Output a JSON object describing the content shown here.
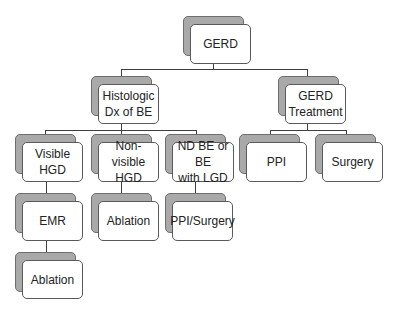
{
  "diagram": {
    "type": "tree",
    "nodes": {
      "root": {
        "label": "GERD"
      },
      "histologic": {
        "label": "Histologic\nDx of BE"
      },
      "treatment": {
        "label": "GERD\nTreatment"
      },
      "visible_hgd": {
        "label": "Visible HGD"
      },
      "nonvisible_hgd": {
        "label": "Non-visible\nHGD"
      },
      "ndbe_lgd": {
        "label": "ND BE or BE\nwith LGD"
      },
      "ppi": {
        "label": "PPI"
      },
      "surgery": {
        "label": "Surgery"
      },
      "emr": {
        "label": "EMR"
      },
      "ablation_nonvisible": {
        "label": "Ablation"
      },
      "ppi_surgery": {
        "label": "PPI/Surgery"
      },
      "ablation_after_emr": {
        "label": "Ablation"
      }
    },
    "edges": [
      [
        "root",
        "histologic"
      ],
      [
        "root",
        "treatment"
      ],
      [
        "histologic",
        "visible_hgd"
      ],
      [
        "histologic",
        "nonvisible_hgd"
      ],
      [
        "histologic",
        "ndbe_lgd"
      ],
      [
        "treatment",
        "ppi"
      ],
      [
        "treatment",
        "surgery"
      ],
      [
        "visible_hgd",
        "emr"
      ],
      [
        "nonvisible_hgd",
        "ablation_nonvisible"
      ],
      [
        "ndbe_lgd",
        "ppi_surgery"
      ],
      [
        "emr",
        "ablation_after_emr"
      ]
    ],
    "colors": {
      "box_fill": "#ffffff",
      "box_border": "#5a5a5a",
      "shadow_fill": "#a9a9a9",
      "connector": "#3e3e3e",
      "text": "#222222"
    }
  }
}
